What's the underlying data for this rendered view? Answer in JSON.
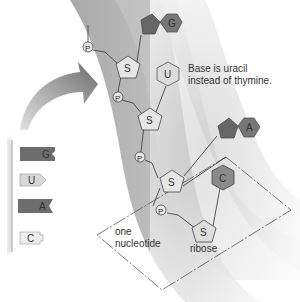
{
  "annotations": {
    "base_note_line1": "Base is uracil",
    "base_note_line2": "instead of thymine.",
    "nucleotide_line1": "one",
    "nucleotide_line2": "nucleotide",
    "sugar_label": "ribose"
  },
  "strand": {
    "phosphate_symbol": "P",
    "sugar_symbol": "S",
    "bases": [
      {
        "letter": "G",
        "shape": "purine",
        "color": "#6b6b6b"
      },
      {
        "letter": "U",
        "shape": "pyrimidine",
        "color": "#dcdcdc"
      },
      {
        "letter": "A",
        "shape": "purine",
        "color": "#6b6b6b"
      },
      {
        "letter": "C",
        "shape": "pyrimidine",
        "color": "#8a8a8a"
      }
    ]
  },
  "legend": {
    "items": [
      {
        "letter": "G",
        "color": "#6e6e6e"
      },
      {
        "letter": "U",
        "color": "#d8d8d8"
      },
      {
        "letter": "A",
        "color": "#6e6e6e"
      },
      {
        "letter": "C",
        "color": "#e8e8e8"
      }
    ]
  },
  "colors": {
    "backbone_band": "#b8b8b8",
    "band_light": "#d6d6d6",
    "arrow": "#8c8c8c",
    "line": "#444444"
  }
}
